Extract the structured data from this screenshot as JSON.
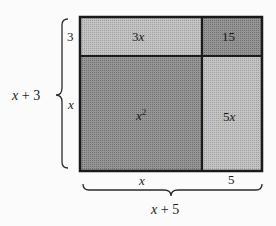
{
  "diagram": {
    "colors": {
      "light_region": "#bdbdbd",
      "dark_region": "#8c8c8c",
      "border": "#1a1a1a",
      "background": "#fbfbfb"
    },
    "regions": [
      {
        "id": "top-left",
        "label": "3x",
        "var": "x",
        "coef": "3",
        "shade": "light"
      },
      {
        "id": "top-right",
        "label": "15",
        "shade": "dark"
      },
      {
        "id": "bottom-left",
        "label": "x²",
        "var": "x",
        "exp": "2",
        "shade": "dark"
      },
      {
        "id": "bottom-right",
        "label": "5x",
        "var": "x",
        "coef": "5",
        "shade": "light"
      }
    ],
    "side_labels": {
      "top_row_height": "3",
      "bottom_row_height": "x",
      "left_col_width": "x",
      "right_col_width": "5"
    },
    "brace_labels": {
      "vertical_total": "x + 3",
      "horizontal_total": "x + 5"
    }
  }
}
